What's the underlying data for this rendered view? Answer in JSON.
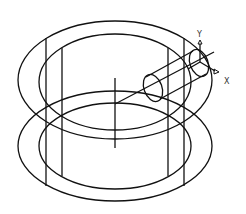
{
  "diagram": {
    "type": "cad-wireframe-isometric",
    "line_color": "#111111",
    "background": "#ffffff",
    "ucs_icon": {
      "x_label": "X",
      "y_label": "Y"
    },
    "parts": [
      {
        "name": "upper-ring",
        "description": "Upper annular ring (outer and inner ellipses)"
      },
      {
        "name": "lower-ring",
        "description": "Lower annular ring (outer and inner ellipses)"
      },
      {
        "name": "vertical-posts",
        "description": "Four vertical connecting lines"
      },
      {
        "name": "center-axis",
        "description": "Vertical center line"
      },
      {
        "name": "cylinder",
        "description": "Small cylinder oriented along X axis"
      }
    ]
  }
}
